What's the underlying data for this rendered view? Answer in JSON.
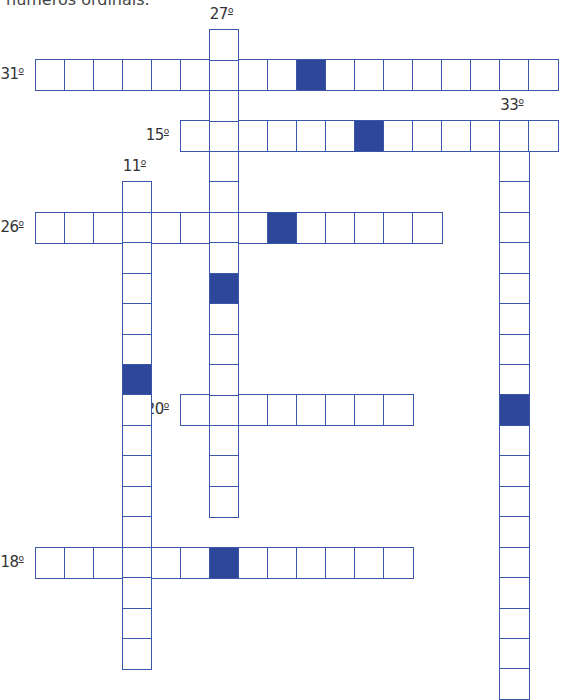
{
  "header": {
    "text": "números ordinais."
  },
  "colors": {
    "border": "#3b55a8",
    "filled": "#2e479a",
    "label": "#333333"
  },
  "words": [
    {
      "id": "31",
      "label": "31",
      "suffix": "º",
      "direction": "across",
      "row": 1,
      "col": 0,
      "length": 18,
      "filled": [
        9
      ],
      "label_pos": "left"
    },
    {
      "id": "15",
      "label": "15",
      "suffix": "º",
      "direction": "across",
      "row": 3,
      "col": 5,
      "length": 13,
      "filled": [
        6
      ],
      "label_pos": "left"
    },
    {
      "id": "26",
      "label": "26",
      "suffix": "º",
      "direction": "across",
      "row": 6,
      "col": 0,
      "length": 14,
      "filled": [
        8
      ],
      "label_pos": "left"
    },
    {
      "id": "20",
      "label": "20",
      "suffix": "º",
      "direction": "across",
      "row": 12,
      "col": 5,
      "length": 8,
      "filled": [],
      "label_pos": "left"
    },
    {
      "id": "18",
      "label": "18",
      "suffix": "º",
      "direction": "across",
      "row": 17,
      "col": 0,
      "length": 13,
      "filled": [
        6
      ],
      "label_pos": "left"
    },
    {
      "id": "27",
      "label": "27",
      "suffix": "º",
      "direction": "down",
      "row": 0,
      "col": 6,
      "length": 16,
      "filled": [
        8
      ],
      "label_pos": "top"
    },
    {
      "id": "11",
      "label": "11",
      "suffix": "º",
      "direction": "down",
      "row": 5,
      "col": 3,
      "length": 16,
      "filled": [
        6
      ],
      "label_pos": "top"
    },
    {
      "id": "33",
      "label": "33",
      "suffix": "º",
      "direction": "down",
      "row": 3,
      "col": 16,
      "length": 19,
      "filled": [
        9
      ],
      "label_pos": "top"
    }
  ]
}
